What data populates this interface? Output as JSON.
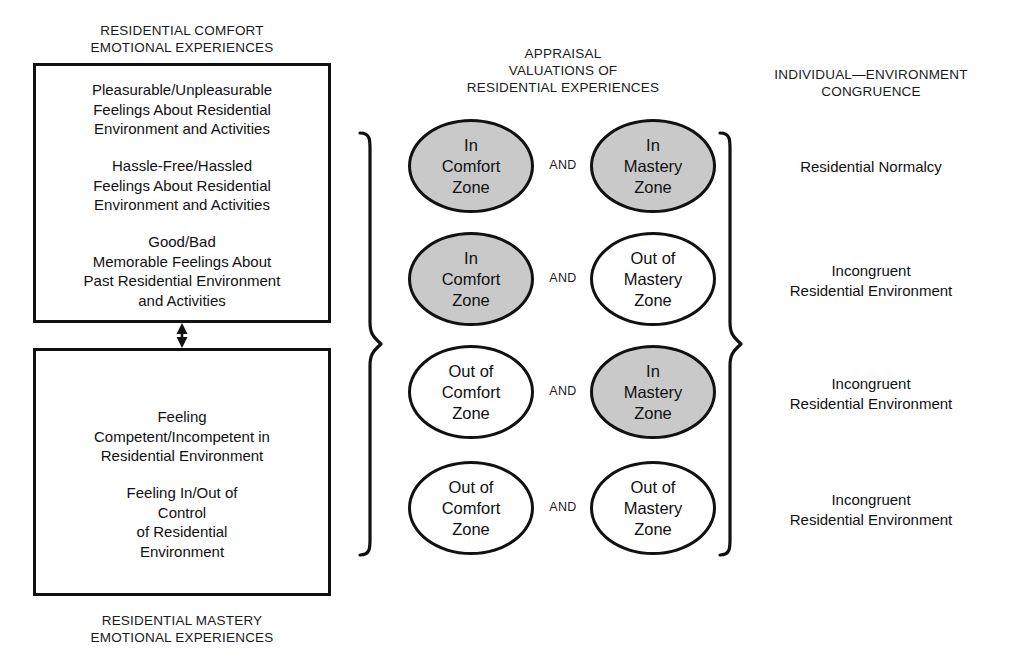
{
  "diagram": {
    "title_comfort": "RESIDENTIAL COMFORT\nEMOTIONAL EXPERIENCES",
    "title_mastery": "RESIDENTIAL MASTERY\nEMOTIONAL EXPERIENCES",
    "title_appraisal": "APPRAISAL\nVALUATIONS OF\nRESIDENTIAL EXPERIENCES",
    "title_congruence": "INDIVIDUAL—ENVIRONMENT\nCONGRUENCE",
    "comfort_box": {
      "items": [
        "Pleasurable/Unpleasurable\nFeelings About Residential\nEnvironment and Activities",
        "Hassle-Free/Hassled\nFeelings About Residential\nEnvironment and Activities",
        "Good/Bad\nMemorable Feelings About\nPast Residential Environment\nand Activities"
      ]
    },
    "mastery_box": {
      "items": [
        "Feeling\nCompetent/Incompetent in\nResidential Environment",
        "Feeling In/Out of\nControl\nof Residential\nEnvironment"
      ]
    },
    "connector_arrow": "double-headed-vertical-arrow",
    "and_label": "AND",
    "rows": [
      {
        "comfort": "In\nComfort\nZone",
        "comfort_shaded": true,
        "mastery": "In\nMastery\nZone",
        "mastery_shaded": true,
        "outcome": "Residential Normalcy"
      },
      {
        "comfort": "In\nComfort\nZone",
        "comfort_shaded": true,
        "mastery": "Out of\nMastery\nZone",
        "mastery_shaded": false,
        "outcome": "Incongruent\nResidential Environment"
      },
      {
        "comfort": "Out of\nComfort\nZone",
        "comfort_shaded": false,
        "mastery": "In\nMastery\nZone",
        "mastery_shaded": true,
        "outcome": "Incongruent\nResidential Environment"
      },
      {
        "comfort": "Out of\nComfort\nZone",
        "comfort_shaded": false,
        "mastery": "Out of\nMastery\nZone",
        "mastery_shaded": false,
        "outcome": "Incongruent\nResidential Environment"
      }
    ],
    "colors": {
      "shaded_fill": "#c9c9c9",
      "stroke": "#111111",
      "background": "#ffffff"
    }
  }
}
